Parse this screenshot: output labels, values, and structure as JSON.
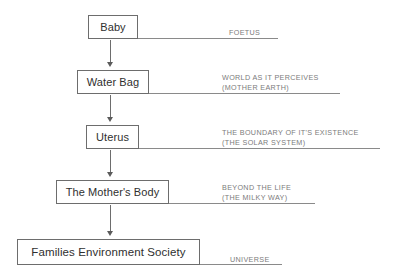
{
  "diagram": {
    "type": "vertical-flowchart",
    "nodes": [
      {
        "id": "baby",
        "label": "Baby"
      },
      {
        "id": "waterbag",
        "label": "Water Bag"
      },
      {
        "id": "uterus",
        "label": "Uterus"
      },
      {
        "id": "mother",
        "label": "The Mother's Body"
      },
      {
        "id": "families",
        "label": "Families Environment Society"
      }
    ],
    "annotations": [
      {
        "id": "foetus",
        "line1": "FOETUS",
        "line2": ""
      },
      {
        "id": "world",
        "line1": "WORLD AS IT PERCEIVES",
        "line2": "(MOTHER EARTH)"
      },
      {
        "id": "boundary",
        "line1": "THE BOUNDARY OF IT'S EXISTENCE",
        "line2": "(THE SOLAR SYSTEM)"
      },
      {
        "id": "beyond",
        "line1": "BEYOND THE LIFE",
        "line2": "(THE MILKY WAY)"
      },
      {
        "id": "universe",
        "line1": "UNIVERSE",
        "line2": ""
      }
    ],
    "colors": {
      "box_border": "#6d6d6d",
      "box_text": "#2f2f2f",
      "annotation_text": "#7b7b7b",
      "rule_line": "#8a8a8a",
      "arrow": "#5b5b5b",
      "background": "#ffffff"
    }
  }
}
